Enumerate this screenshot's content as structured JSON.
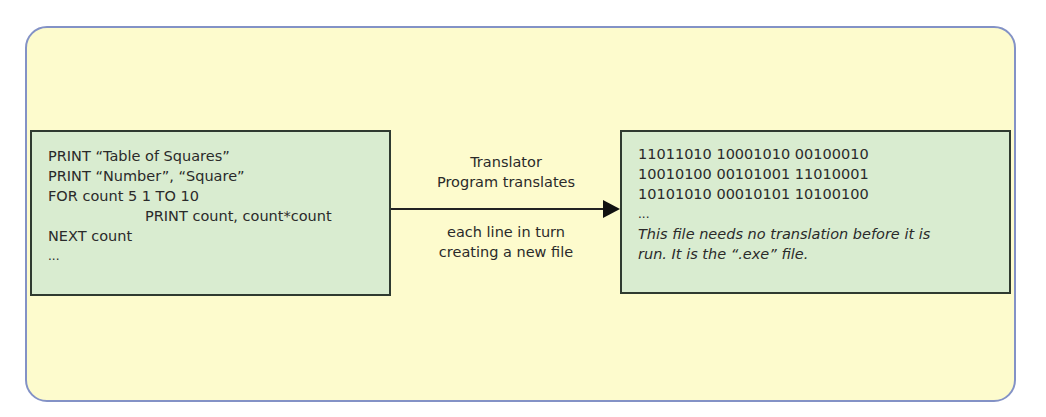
{
  "source_box": {
    "lines": [
      "PRINT “Table of Squares”",
      "PRINT “Number”, “Square”",
      "FOR count 5 1 TO 10",
      "PRINT count, count*count",
      "NEXT count",
      "..."
    ]
  },
  "arrow": {
    "label_top": [
      "Translator",
      "Program translates"
    ],
    "label_bottom": [
      "each line in turn",
      "creating a new file"
    ]
  },
  "output_box": {
    "binary_lines": [
      "11011010 10001010 00100010",
      "10010100 00101001 11010001",
      "10101010 00010101 10100100",
      "..."
    ],
    "note_lines": [
      "This file needs no translation before it is",
      "run. It is the “.exe” file."
    ]
  },
  "colors": {
    "outer_fill": "#fdfbcd",
    "outer_border": "#8392c6",
    "box_fill": "#d9ecd0",
    "box_border": "#2f3a30"
  }
}
